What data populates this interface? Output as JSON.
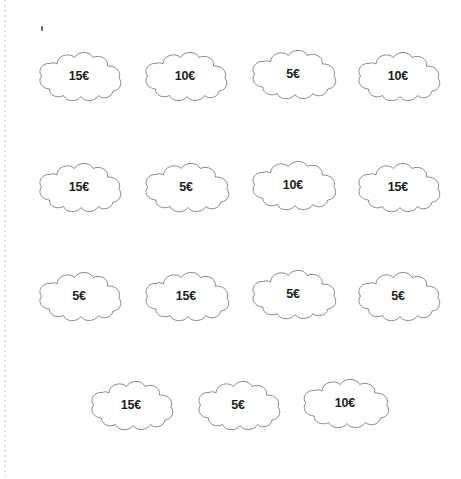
{
  "page": {
    "background_color": "#ffffff",
    "width": 461,
    "height": 479,
    "margin_rule_color": "#e2e0e0",
    "cloud_outline_color": "#3a3a3a",
    "cloud_fill_color": "#ffffff",
    "label_color": "#1d1d1d"
  },
  "clouds": [
    {
      "label": "15€",
      "row": 1,
      "col": 1,
      "x": 34,
      "y": 49,
      "w": 90,
      "h": 58
    },
    {
      "label": "10€",
      "row": 1,
      "col": 2,
      "x": 140,
      "y": 49,
      "w": 90,
      "h": 58
    },
    {
      "label": "5€",
      "row": 1,
      "col": 3,
      "x": 247,
      "y": 47,
      "w": 92,
      "h": 58
    },
    {
      "label": "10€",
      "row": 1,
      "col": 4,
      "x": 353,
      "y": 49,
      "w": 90,
      "h": 58
    },
    {
      "label": "15€",
      "row": 2,
      "col": 1,
      "x": 34,
      "y": 160,
      "w": 90,
      "h": 58
    },
    {
      "label": "5€",
      "row": 2,
      "col": 2,
      "x": 140,
      "y": 160,
      "w": 92,
      "h": 58
    },
    {
      "label": "10€",
      "row": 2,
      "col": 3,
      "x": 247,
      "y": 158,
      "w": 92,
      "h": 58
    },
    {
      "label": "15€",
      "row": 2,
      "col": 4,
      "x": 353,
      "y": 160,
      "w": 90,
      "h": 58
    },
    {
      "label": "5€",
      "row": 3,
      "col": 1,
      "x": 34,
      "y": 269,
      "w": 90,
      "h": 58
    },
    {
      "label": "15€",
      "row": 3,
      "col": 2,
      "x": 140,
      "y": 269,
      "w": 92,
      "h": 58
    },
    {
      "label": "5€",
      "row": 3,
      "col": 3,
      "x": 247,
      "y": 267,
      "w": 92,
      "h": 58
    },
    {
      "label": "5€",
      "row": 3,
      "col": 4,
      "x": 353,
      "y": 269,
      "w": 90,
      "h": 58
    },
    {
      "label": "15€",
      "row": 4,
      "col": 1,
      "x": 86,
      "y": 378,
      "w": 90,
      "h": 58
    },
    {
      "label": "5€",
      "row": 4,
      "col": 2,
      "x": 193,
      "y": 378,
      "w": 90,
      "h": 58
    },
    {
      "label": "10€",
      "row": 4,
      "col": 3,
      "x": 298,
      "y": 376,
      "w": 94,
      "h": 58
    }
  ]
}
